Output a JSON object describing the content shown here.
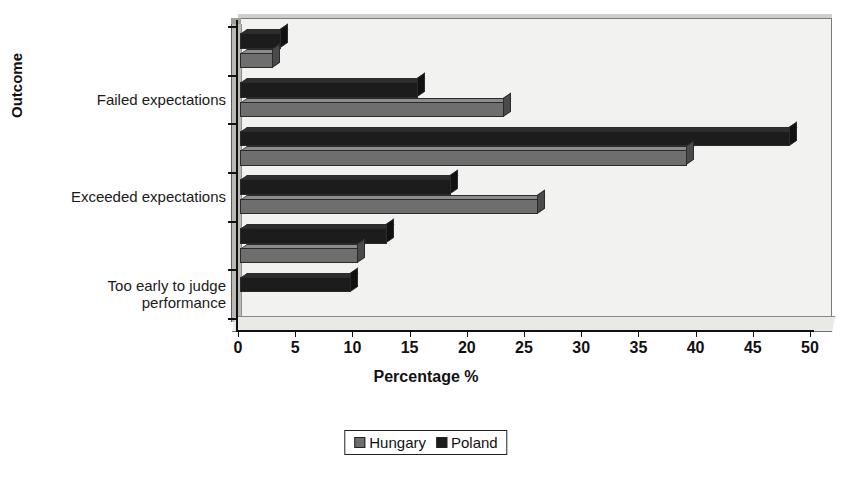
{
  "chart_data": {
    "type": "bar",
    "orientation": "horizontal",
    "title": "",
    "xlabel": "Percentage %",
    "ylabel": "Outcome",
    "xlim": [
      0,
      50
    ],
    "xticks": [
      0,
      5,
      10,
      15,
      20,
      25,
      30,
      35,
      40,
      45,
      50
    ],
    "xtick_labels": [
      "0",
      "5",
      "10",
      "15",
      "20",
      "25",
      "30",
      "35",
      "40",
      "45",
      "50"
    ],
    "grid": false,
    "legend_position": "bottom-center",
    "categories": [
      "",
      "Failed expectations",
      "",
      "Exceeded expectations",
      "",
      "Too early to judge\nperformance"
    ],
    "visible_category_labels": [
      "Failed expectations",
      "Exceeded expectations",
      "Too early to judge\nperformance"
    ],
    "series": [
      {
        "name": "Poland",
        "color": "#1c1c1c",
        "values": [
          3.5,
          15.5,
          48.0,
          18.4,
          12.8,
          9.6
        ]
      },
      {
        "name": "Hungary",
        "color": "#6e6e6e",
        "values": [
          2.8,
          23.0,
          39.0,
          26.0,
          10.2,
          0.0
        ]
      }
    ]
  },
  "axes": {
    "x_title": "Percentage %",
    "y_title": "Outcome"
  },
  "legend": {
    "items": [
      {
        "label": "Hungary",
        "color": "#6e6e6e",
        "swatch": "hungary-swatch"
      },
      {
        "label": "Poland",
        "color": "#1c1c1c",
        "swatch": "poland-swatch"
      }
    ]
  }
}
